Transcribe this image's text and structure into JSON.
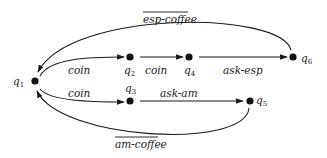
{
  "diagram": {
    "type": "state-transition-graph",
    "nodes": [
      {
        "id": "q1",
        "base": "q",
        "sub": "1",
        "x": 35,
        "y": 81
      },
      {
        "id": "q2",
        "base": "q",
        "sub": "2",
        "x": 130,
        "y": 57
      },
      {
        "id": "q4",
        "base": "q",
        "sub": "4",
        "x": 189,
        "y": 57
      },
      {
        "id": "q6",
        "base": "q",
        "sub": "6",
        "x": 293,
        "y": 57
      },
      {
        "id": "q3",
        "base": "q",
        "sub": "3",
        "x": 130,
        "y": 101
      },
      {
        "id": "q5",
        "base": "q",
        "sub": "5",
        "x": 250,
        "y": 101
      }
    ],
    "edges": [
      {
        "from": "q1",
        "to": "q2",
        "label": "coin",
        "overline": false
      },
      {
        "from": "q2",
        "to": "q4",
        "label": "coin",
        "overline": false
      },
      {
        "from": "q4",
        "to": "q6",
        "label": "ask-esp",
        "overline": false
      },
      {
        "from": "q6",
        "to": "q1",
        "label": "esp-coffee",
        "overline": true
      },
      {
        "from": "q1",
        "to": "q3",
        "label": "coin",
        "overline": false
      },
      {
        "from": "q3",
        "to": "q5",
        "label": "ask-am",
        "overline": false
      },
      {
        "from": "q5",
        "to": "q1",
        "label": "am-coffee",
        "overline": true
      }
    ]
  },
  "labels": {
    "q1": {
      "base": "q",
      "sub": "1"
    },
    "q2": {
      "base": "q",
      "sub": "2"
    },
    "q3": {
      "base": "q",
      "sub": "3"
    },
    "q4": {
      "base": "q",
      "sub": "4"
    },
    "q5": {
      "base": "q",
      "sub": "5"
    },
    "q6": {
      "base": "q",
      "sub": "6"
    },
    "e_q1_q2": "coin",
    "e_q2_q4": "coin",
    "e_q4_q6": "ask-esp",
    "e_q6_q1": "esp-coffee",
    "e_q1_q3": "coin",
    "e_q3_q5": "ask-am",
    "e_q5_q1": "am-coffee"
  },
  "colors": {
    "ink": "#1a1a1a",
    "background": "#ffffff"
  }
}
